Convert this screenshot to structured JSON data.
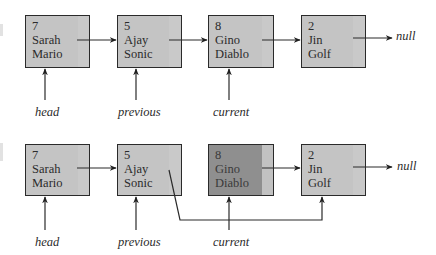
{
  "diagrams": [
    {
      "name": "before-removal",
      "nodes": [
        {
          "id": "7",
          "first": "Sarah",
          "last": "Mario"
        },
        {
          "id": "5",
          "first": "Ajay",
          "last": "Sonic"
        },
        {
          "id": "8",
          "first": "Gino",
          "last": "Diablo"
        },
        {
          "id": "2",
          "first": "Jin",
          "last": "Golf"
        }
      ],
      "pointers": [
        "head",
        "previous",
        "current"
      ],
      "terminal": "null"
    },
    {
      "name": "after-removal",
      "nodes": [
        {
          "id": "7",
          "first": "Sarah",
          "last": "Mario"
        },
        {
          "id": "5",
          "first": "Ajay",
          "last": "Sonic"
        },
        {
          "id": "8",
          "first": "Gino",
          "last": "Diablo",
          "state": "removed"
        },
        {
          "id": "2",
          "first": "Jin",
          "last": "Golf"
        }
      ],
      "pointers": [
        "head",
        "previous",
        "current"
      ],
      "terminal": "null"
    }
  ],
  "colors": {
    "node_fill": "#c4c4c4",
    "removed_fill": "#8f8f8f",
    "stroke": "#2a2a2a"
  }
}
